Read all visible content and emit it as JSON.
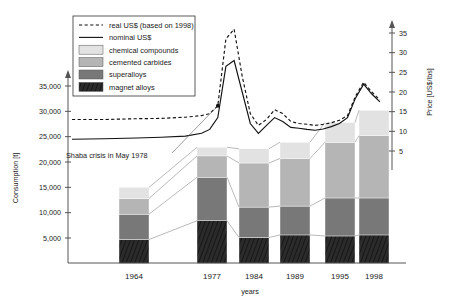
{
  "chart_data": {
    "type": "bar",
    "title": "",
    "subtitle": "",
    "xlabel": "years",
    "ylabel": "Consumption [t]",
    "y2label": "Price [US$/lbs]",
    "grid": false,
    "legend_position": "top-left",
    "categories": [
      "1964",
      "1977",
      "1984",
      "1989",
      "1995",
      "1998"
    ],
    "ylim": [
      0,
      37000
    ],
    "yticks": [
      "5,000",
      "10,000",
      "15,000",
      "20,000",
      "25,000",
      "30,000",
      "35,000"
    ],
    "ytick_values": [
      5000,
      10000,
      15000,
      20000,
      25000,
      30000,
      35000
    ],
    "y2lim": [
      0,
      38
    ],
    "y2ticks": [
      "5",
      "10",
      "15",
      "20",
      "25",
      "30",
      "35"
    ],
    "y2tick_values": [
      5,
      10,
      15,
      20,
      25,
      30,
      35
    ],
    "stacked": true,
    "series": [
      {
        "name": "magnet alloys",
        "color": "#2b2b2b",
        "values": [
          4700,
          8400,
          5100,
          5600,
          5400,
          5600
        ]
      },
      {
        "name": "superalloys",
        "color": "#787878",
        "values": [
          5000,
          8600,
          6000,
          5700,
          7500,
          7300
        ]
      },
      {
        "name": "cemented carbides",
        "color": "#b5b5b5",
        "values": [
          3100,
          4200,
          8700,
          9400,
          11000,
          12300
        ]
      },
      {
        "name": "chemical compounds",
        "color": "#e2e2e2",
        "values": [
          2200,
          1700,
          2800,
          3200,
          3900,
          5000
        ]
      }
    ],
    "bar_totals": [
      15000,
      22900,
      22600,
      23900,
      27800,
      30200
    ],
    "lines": [
      {
        "name": "real US$ (based on 1998)",
        "style": "dashed",
        "axis": "right",
        "x": [
          1960,
          1964,
          1968,
          1971,
          1974,
          1976,
          1977,
          1978,
          1979,
          1980,
          1981,
          1982,
          1983,
          1984,
          1985,
          1986,
          1987,
          1988,
          1989,
          1990,
          1991,
          1992,
          1993,
          1994,
          1995,
          1996,
          1997,
          1998
        ],
        "y": [
          13.0,
          13.0,
          13.2,
          13.3,
          13.6,
          14.0,
          14.5,
          16.5,
          33.5,
          36.0,
          24.0,
          14.5,
          11.5,
          13.0,
          15.5,
          14.5,
          12.5,
          12.0,
          11.8,
          11.5,
          11.8,
          12.2,
          12.8,
          14.0,
          19.0,
          22.5,
          20.0,
          18.0
        ]
      },
      {
        "name": "nominal US$",
        "style": "solid",
        "axis": "right",
        "x": [
          1960,
          1964,
          1968,
          1971,
          1974,
          1976,
          1977,
          1978,
          1979,
          1980,
          1981,
          1982,
          1983,
          1984,
          1985,
          1986,
          1987,
          1988,
          1989,
          1990,
          1991,
          1992,
          1993,
          1994,
          1995,
          1996,
          1997,
          1998
        ],
        "y": [
          8.0,
          8.1,
          8.3,
          8.5,
          8.8,
          9.5,
          10.5,
          13.5,
          26.5,
          28.0,
          20.0,
          12.0,
          9.5,
          11.5,
          13.5,
          12.5,
          11.0,
          10.8,
          10.5,
          10.3,
          10.6,
          11.2,
          12.0,
          13.5,
          18.5,
          22.0,
          19.5,
          17.5
        ]
      }
    ],
    "annotations": [
      {
        "text": "Shaba crisis in May 1978",
        "x": 1978,
        "y": 16.5
      }
    ]
  },
  "legend": {
    "items": [
      {
        "label": "real US$ (based on 1998)",
        "marker": "dashed-line"
      },
      {
        "label": "nominal US$",
        "marker": "solid-line"
      },
      {
        "label": "chemical compounds",
        "marker": "swatch",
        "color": "#e2e2e2"
      },
      {
        "label": "cemented carbides",
        "marker": "swatch",
        "color": "#b5b5b5"
      },
      {
        "label": "superalloys",
        "marker": "swatch",
        "color": "#787878"
      },
      {
        "label": "magnet alloys",
        "marker": "swatch",
        "color": "#2b2b2b"
      }
    ]
  },
  "axes": {
    "left_title": "Consumption [t]",
    "right_title": "Price [US$/lbs]",
    "x_title": "years",
    "ytick_0": "5,000",
    "ytick_1": "10,000",
    "ytick_2": "15,000",
    "ytick_3": "20,000",
    "ytick_4": "25,000",
    "ytick_5": "30,000",
    "ytick_6": "35,000",
    "y2tick_0": "5",
    "y2tick_1": "10",
    "y2tick_2": "15",
    "y2tick_3": "20",
    "y2tick_4": "25",
    "y2tick_5": "30",
    "y2tick_6": "35",
    "cat_0": "1964",
    "cat_1": "1977",
    "cat_2": "1984",
    "cat_3": "1989",
    "cat_4": "1995",
    "cat_5": "1998"
  },
  "annotation": {
    "shaba": "Shaba crisis in May 1978"
  }
}
